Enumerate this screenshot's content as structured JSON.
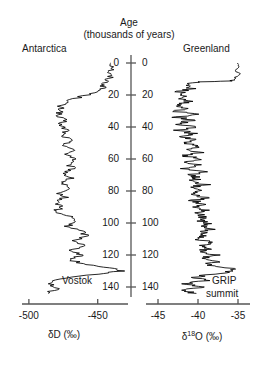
{
  "figure": {
    "axis_title_line1": "Age",
    "axis_title_line2": "(thousands of years)",
    "left_region_label": "Antarctica",
    "right_region_label": "Greenland",
    "left_core_label": "Vostok",
    "right_core_label_line1": "GRIP",
    "right_core_label_line2": "summit",
    "left_axis_caption": "δD (‰)",
    "right_axis_caption_prefix": "δ",
    "right_axis_caption_sup": "18",
    "right_axis_caption_suffix": "O (‰)",
    "line_color": "#000000",
    "axis_color": "#555555"
  },
  "chart_data": {
    "type": "line",
    "orientation": "vertical-age-axis-downward",
    "grid": false,
    "legend": "none",
    "age_axis": {
      "label": "Age (thousands of years)",
      "units": "kyr BP",
      "ticks": [
        0,
        20,
        40,
        60,
        80,
        100,
        120,
        140
      ],
      "tick_labels": [
        "0",
        "20",
        "40",
        "60",
        "80",
        "100",
        "120",
        "140"
      ],
      "range": [
        0,
        145
      ],
      "direction": "increasing downward",
      "shared_by": [
        "Vostok",
        "GRIP summit"
      ],
      "labels_on_both_sides": true
    },
    "series": [
      {
        "name": "Vostok",
        "region": "Antarctica",
        "panel": "left",
        "xlabel": "δD (‰)",
        "xticks": [
          -500,
          -450
        ],
        "xtick_labels": [
          "-500",
          "-450"
        ],
        "xlim": [
          -505,
          -428
        ],
        "x_direction": "increasing rightward (warmer)",
        "age": [
          0,
          3,
          6,
          9,
          12,
          15,
          18,
          21,
          24,
          27,
          30,
          33,
          36,
          39,
          42,
          45,
          48,
          51,
          54,
          57,
          60,
          63,
          66,
          69,
          72,
          75,
          78,
          81,
          84,
          87,
          90,
          93,
          96,
          99,
          102,
          105,
          108,
          111,
          114,
          117,
          120,
          123,
          126,
          128,
          130,
          132,
          135,
          138,
          141,
          144
        ],
        "values": [
          -440,
          -438,
          -442,
          -441,
          -444,
          -446,
          -450,
          -462,
          -472,
          -478,
          -476,
          -480,
          -474,
          -478,
          -472,
          -476,
          -470,
          -474,
          -468,
          -472,
          -466,
          -472,
          -468,
          -474,
          -470,
          -476,
          -472,
          -478,
          -474,
          -480,
          -476,
          -482,
          -470,
          -466,
          -472,
          -462,
          -458,
          -466,
          -460,
          -468,
          -462,
          -470,
          -458,
          -440,
          -432,
          -452,
          -478,
          -484,
          -480,
          -486
        ],
        "high_frequency_noise_amplitude": 4,
        "features": [
          {
            "label": "Holocene warm plateau",
            "age_range": [
              0,
              12
            ],
            "value": -440
          },
          {
            "label": "Last Glacial Maximum cold",
            "age_range": [
              18,
              24
            ],
            "value": -478
          },
          {
            "label": "Eemian interglacial peak",
            "age_range": [
              128,
              132
            ],
            "value": -432
          }
        ]
      },
      {
        "name": "GRIP summit",
        "region": "Greenland",
        "panel": "right",
        "xlabel": "δ18O (‰)",
        "xticks": [
          -45,
          -40,
          -35
        ],
        "xtick_labels": [
          "-45",
          "-40",
          "-35"
        ],
        "xlim": [
          -46.5,
          -33.5
        ],
        "x_direction": "increasing rightward (warmer)",
        "age": [
          0,
          3,
          6,
          9,
          11,
          12,
          14,
          16,
          18,
          20,
          22,
          24,
          26,
          28,
          30,
          32,
          34,
          36,
          38,
          40,
          42,
          44,
          46,
          48,
          50,
          52,
          54,
          56,
          58,
          60,
          62,
          64,
          66,
          68,
          70,
          72,
          74,
          76,
          78,
          80,
          82,
          84,
          86,
          88,
          90,
          92,
          94,
          96,
          98,
          100,
          102,
          104,
          106,
          108,
          110,
          112,
          114,
          116,
          118,
          120,
          122,
          124,
          126,
          128,
          130,
          132,
          134,
          136,
          138,
          140,
          142,
          144
        ],
        "values": [
          -35,
          -35.2,
          -34.9,
          -35.3,
          -35.5,
          -40.5,
          -41.5,
          -40.8,
          -42.2,
          -41.8,
          -42.6,
          -41.2,
          -42.8,
          -41.6,
          -42.9,
          -40.4,
          -42.5,
          -40.8,
          -42.6,
          -40.2,
          -42.4,
          -40.6,
          -42.2,
          -40.1,
          -42.0,
          -39.8,
          -41.8,
          -40.0,
          -41.6,
          -39.6,
          -41.4,
          -39.9,
          -41.5,
          -39.4,
          -41.2,
          -39.8,
          -41.0,
          -39.2,
          -40.8,
          -39.5,
          -41.0,
          -39.0,
          -40.6,
          -39.3,
          -40.4,
          -38.8,
          -40.2,
          -39.1,
          -40.0,
          -38.6,
          -39.8,
          -38.4,
          -39.6,
          -38.9,
          -40.2,
          -38.2,
          -39.4,
          -38.6,
          -40.0,
          -38.0,
          -39.2,
          -37.6,
          -38.8,
          -36.2,
          -35.2,
          -38.4,
          -40.6,
          -39.0,
          -41.4,
          -39.6,
          -41.8,
          -40.2
        ],
        "high_frequency_noise_amplitude": 1.1,
        "features": [
          {
            "label": "Holocene warm plateau",
            "age_range": [
              0,
              11
            ],
            "value": -35
          },
          {
            "label": "Dansgaard-Oeschger oscillations",
            "age_range": [
              12,
              110
            ],
            "description": "rapid sawtooth interstadial spikes"
          },
          {
            "label": "Eemian interglacial peak",
            "age_range": [
              128,
              130
            ],
            "value": -35.2
          }
        ]
      }
    ]
  }
}
